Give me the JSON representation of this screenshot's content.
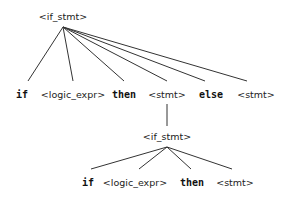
{
  "diagram": {
    "type": "parse-tree",
    "root": {
      "label": "<if_stmt>",
      "children": [
        {
          "label": "if",
          "kind": "terminal"
        },
        {
          "label": "<logic_expr>",
          "kind": "nonterminal"
        },
        {
          "label": "then",
          "kind": "terminal"
        },
        {
          "label": "<stmt>",
          "kind": "nonterminal",
          "child": {
            "label": "<if_stmt>",
            "children": [
              {
                "label": "if",
                "kind": "terminal"
              },
              {
                "label": "<logic_expr>",
                "kind": "nonterminal"
              },
              {
                "label": "then",
                "kind": "terminal"
              },
              {
                "label": "<stmt>",
                "kind": "nonterminal"
              }
            ]
          }
        },
        {
          "label": "else",
          "kind": "terminal"
        },
        {
          "label": "<stmt>",
          "kind": "nonterminal"
        }
      ]
    }
  },
  "labels": {
    "root": "<if_stmt>",
    "l1": [
      "if",
      "<logic_expr>",
      "then",
      "<stmt>",
      "else",
      "<stmt>"
    ],
    "nested": "<if_stmt>",
    "l2": [
      "if",
      "<logic_expr>",
      "then",
      "<stmt>"
    ]
  },
  "colors": {
    "line": "#333333",
    "text": "#222222",
    "background": "#ffffff"
  }
}
